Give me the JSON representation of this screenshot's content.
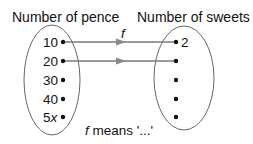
{
  "diagram": {
    "domain_title": "Number of pence",
    "codomain_title": "Number of sweets",
    "function_name": "f",
    "caption_fn": "f",
    "caption_text": " means '...'",
    "domain_values": [
      "10",
      "20",
      "30",
      "40",
      "5x"
    ],
    "codomain_values": [
      "2",
      "",
      "",
      "",
      ""
    ],
    "mappings": [
      {
        "from": "10",
        "to": "2"
      },
      {
        "from": "20",
        "to": ""
      }
    ],
    "colors": {
      "ellipse": "#666666",
      "arrow": "#7a7a7a",
      "dot": "#111111"
    }
  }
}
